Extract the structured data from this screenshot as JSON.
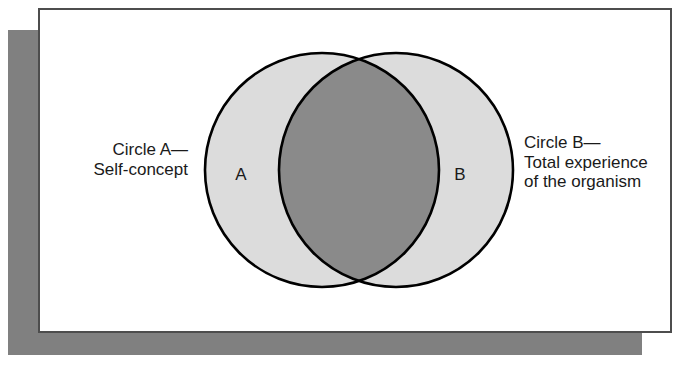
{
  "figure": {
    "name": "venn-diagram-self-concept-experience",
    "background_color": "#ffffff",
    "card": {
      "background_color": "#ffffff",
      "border_color": "#4d4d4d",
      "shadow_color": "#808080"
    }
  },
  "diagram": {
    "type": "venn",
    "sets": [
      {
        "id": "A",
        "letter": "A",
        "label": "Circle A—\nSelf-concept",
        "fill_color": "#dcdcdc",
        "stroke_color": "#000000",
        "center_x": 322,
        "center_y": 170,
        "radius": 117
      },
      {
        "id": "B",
        "letter": "B",
        "label": "Circle B—\nTotal experience\nof the organism",
        "fill_color": "#dcdcdc",
        "stroke_color": "#000000",
        "center_x": 396,
        "center_y": 170,
        "radius": 117
      }
    ],
    "intersection": {
      "fill_color": "#8a8a8a",
      "top_crossing": {
        "x": 359,
        "y": 61
      },
      "bottom_crossing": {
        "x": 359,
        "y": 279
      }
    },
    "stroke_width": 2.6
  }
}
